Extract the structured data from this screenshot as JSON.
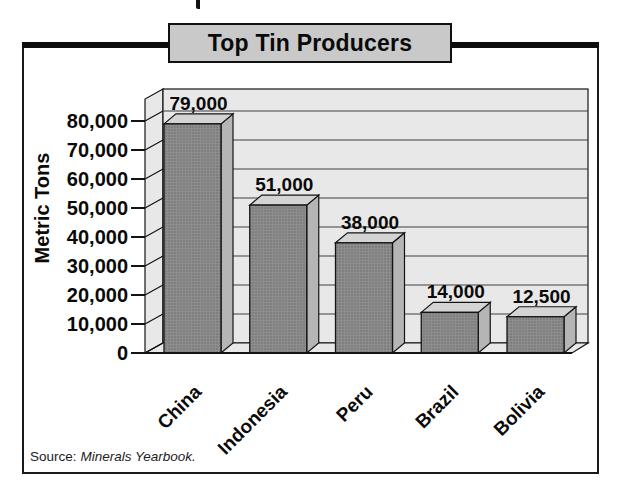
{
  "chart_data": {
    "type": "bar",
    "style": "3d-gray-halftone",
    "title": "Top Tin Producers",
    "categories": [
      "China",
      "Indonesia",
      "Peru",
      "Brazil",
      "Bolivia"
    ],
    "values": [
      79000,
      51000,
      38000,
      14000,
      12500
    ],
    "value_labels": [
      "79,000",
      "51,000",
      "38,000",
      "14,000",
      "12,500"
    ],
    "xlabel": "",
    "ylabel": "Metric Tons",
    "ylim": [
      0,
      80000
    ],
    "yticks": [
      0,
      10000,
      20000,
      30000,
      40000,
      50000,
      60000,
      70000,
      80000
    ],
    "ytick_labels": [
      "0",
      "10,000",
      "20,000",
      "30,000",
      "40,000",
      "50,000",
      "60,000",
      "70,000",
      "80,000"
    ],
    "grid": true,
    "legend": "none"
  },
  "source": {
    "label": "Source:",
    "work": "Minerals Yearbook."
  },
  "colors": {
    "banner_bg": "#c9c9c9",
    "wall": "#e8e8e8",
    "grid": "#3f3f3f",
    "bar_front": "#8d8d8d",
    "bar_front_dot": "#6e6e6e",
    "bar_side": "#b5b5b5",
    "bar_top": "#d4d4d4",
    "outline": "#141414",
    "text": "#0a0a0a"
  }
}
